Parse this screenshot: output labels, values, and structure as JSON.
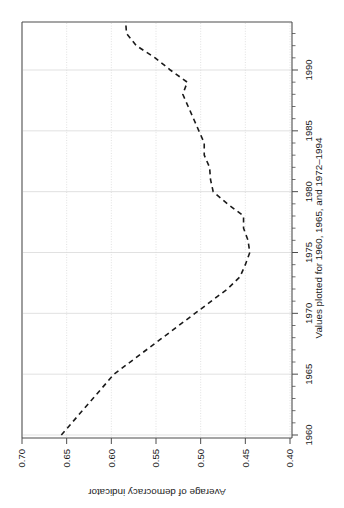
{
  "chart_data": {
    "type": "line",
    "title": "",
    "subtitle": "",
    "orientation": "rotated-90-clockwise",
    "xlabel": "Values plotted for 1960, 1965, and 1972–1994",
    "ylabel": "Average of democracy indicator",
    "xlim": [
      1959.0,
      1994.6
    ],
    "ylim": [
      0.4,
      0.7
    ],
    "xticks": [
      1960,
      1965,
      1970,
      1975,
      1980,
      1985,
      1990
    ],
    "xtick_labels": [
      "1960",
      "1965",
      "1970",
      "1975",
      "1980",
      "1985",
      "1990"
    ],
    "yticks": [
      0.4,
      0.45,
      0.5,
      0.55,
      0.6,
      0.65,
      0.7
    ],
    "ytick_labels": [
      "0.40",
      "0.45",
      "0.50",
      "0.55",
      "0.60",
      "0.65",
      "0.70"
    ],
    "grid": true,
    "grid_color": "#d9d9d9",
    "legend": false,
    "line_style": "dashed",
    "line_color": "#1a1a1a",
    "line_width": 1.6,
    "frame_color": "#4d4d4d",
    "x": [
      1960,
      1965,
      1972,
      1973,
      1974,
      1975,
      1976,
      1977,
      1978,
      1979,
      1980,
      1981,
      1982,
      1983,
      1984,
      1985,
      1986,
      1987,
      1988,
      1989,
      1990,
      1991,
      1992,
      1993,
      1994
    ],
    "values": [
      0.656,
      0.597,
      0.47,
      0.456,
      0.45,
      0.445,
      0.447,
      0.452,
      0.452,
      0.47,
      0.486,
      0.489,
      0.49,
      0.496,
      0.496,
      0.502,
      0.508,
      0.514,
      0.52,
      0.515,
      0.534,
      0.551,
      0.572,
      0.583,
      0.584
    ],
    "series": [
      {
        "name": "Average of democracy indicator",
        "values": [
          0.656,
          0.597,
          0.47,
          0.456,
          0.45,
          0.445,
          0.447,
          0.452,
          0.452,
          0.47,
          0.486,
          0.489,
          0.49,
          0.496,
          0.496,
          0.502,
          0.508,
          0.514,
          0.52,
          0.515,
          0.534,
          0.551,
          0.572,
          0.583,
          0.584
        ]
      }
    ]
  }
}
